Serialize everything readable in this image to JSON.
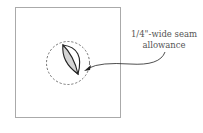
{
  "diagram": {
    "annotation": {
      "line1": "1/4\"-wide seam",
      "line2": "allowance"
    },
    "colors": {
      "square_stroke": "#aaaaaa",
      "shape_stroke": "#222222",
      "shape_fill": "#d4d4d4",
      "dashed_circle": "#555555",
      "text": "#555555"
    }
  }
}
